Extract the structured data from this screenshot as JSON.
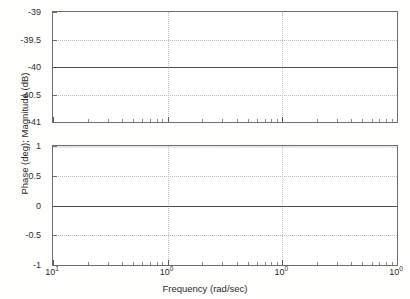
{
  "figure": {
    "background_color": "#fefefd",
    "axes_color": "#6e6e6e",
    "grid_color": "#b9b9b9",
    "trace_color": "#4c4c4c"
  },
  "chart_data": {
    "type": "line",
    "title": "",
    "subtitle": "",
    "xlabel": "Frequency (rad/sec)",
    "ylabel": "Phase (deg); Magnitude (dB)",
    "xscale": "log",
    "grid": true,
    "legend": null,
    "legend_position": "none",
    "xlim": [
      10,
      10000
    ],
    "xtick_labels": [
      "10¹",
      "10⁰",
      "10⁰",
      "10⁰"
    ],
    "xtick_mantissa": "10",
    "xtick_exponents": [
      "1",
      "0",
      "0",
      "0"
    ],
    "panels": [
      {
        "name": "magnitude",
        "ylabel": "Magnitude (dB)",
        "ylim": [
          -41,
          -39
        ],
        "ytick_labels": [
          "-39",
          "-39.5",
          "-40",
          "-40.5",
          "-41"
        ],
        "ytick_values": [
          -39,
          -39.5,
          -40,
          -40.5,
          -41
        ],
        "series": [
          {
            "name": "magnitude",
            "constant_value": -40,
            "x": [
              10,
              100,
              1000,
              10000
            ],
            "values": [
              -40,
              -40,
              -40,
              -40
            ]
          }
        ]
      },
      {
        "name": "phase",
        "ylabel": "Phase (deg)",
        "ylim": [
          -1,
          1
        ],
        "ytick_labels": [
          "1",
          "0.5",
          "0",
          "-0.5",
          "-1"
        ],
        "ytick_values": [
          1,
          0.5,
          0,
          -0.5,
          -1
        ],
        "series": [
          {
            "name": "phase",
            "constant_value": 0,
            "x": [
              10,
              100,
              1000,
              10000
            ],
            "values": [
              0,
              0,
              0,
              0
            ]
          }
        ]
      }
    ]
  }
}
